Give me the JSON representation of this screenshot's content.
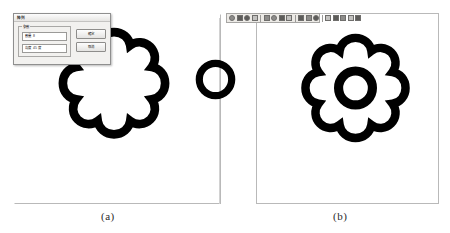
{
  "figure": {
    "captions": {
      "panel_a": "(a)",
      "panel_b": "(b)"
    }
  },
  "panel_a": {
    "name": "drawing-canvas-a",
    "shapes": {
      "gear": {
        "type": "gear-outline",
        "lobes": 8,
        "filled_center": false
      },
      "ring": {
        "type": "ring",
        "lobes": 0
      }
    }
  },
  "panel_b": {
    "name": "drawing-canvas-b",
    "shapes": {
      "gear": {
        "type": "gear-outline",
        "lobes": 8,
        "filled_center": false,
        "inner_ring": true
      }
    },
    "toolbar": {
      "icons": [
        "cursor-icon",
        "pan-icon",
        "zoom-icon",
        "layer-icon",
        "grid-icon",
        "snap-icon",
        "measure-icon",
        "dimension-icon",
        "line-icon",
        "arc-icon",
        "circle-icon",
        "polygon-icon",
        "trim-icon",
        "mirror-icon",
        "array-icon",
        "settings-icon"
      ]
    }
  },
  "dialog": {
    "title": "陣列",
    "group_legend": "參數",
    "fields": [
      {
        "label": "數量",
        "value": "8",
        "unit": ""
      },
      {
        "label": "角度",
        "value": "45",
        "unit": "度"
      }
    ],
    "buttons": {
      "confirm": "確定",
      "cancel": "取消"
    }
  },
  "colors": {
    "stroke": "#000000",
    "panel_border": "#b9b9b9",
    "dialog_face": "#f2f1ef",
    "construction_line": "#d2d2d2"
  }
}
